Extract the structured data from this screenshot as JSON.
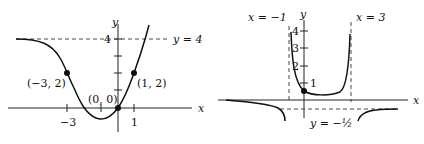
{
  "left_graph": {
    "axis_x_label": "x",
    "axis_y_label": "y",
    "asymptote_label": "y = 4",
    "tick_y": "4",
    "tick_x_neg": "−3",
    "tick_x_pos": "1",
    "points": [
      {
        "label": "(−3, 2)",
        "x": -3,
        "y": 2
      },
      {
        "label": "(1, 2)",
        "x": 1,
        "y": 2
      },
      {
        "label": "(0, 0)",
        "x": 0,
        "y": 0
      }
    ],
    "horizontal_asymptote": 4
  },
  "right_graph": {
    "axis_x_label": "x",
    "axis_y_label": "y",
    "vertical_asymptote_left_label": "x = −1",
    "vertical_asymptote_right_label": "x = 3",
    "horizontal_asymptote_label": "y = −½",
    "ticks_y": [
      "4",
      "3",
      "2",
      "1"
    ],
    "vertical_asymptotes": [
      -1,
      3
    ],
    "horizontal_asymptote": -0.5
  },
  "colors": {
    "curve": "#111111",
    "dashed": "#333333"
  }
}
